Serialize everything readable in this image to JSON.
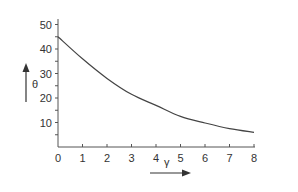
{
  "chart_data": {
    "type": "line",
    "title": "",
    "xlabel": "γ",
    "ylabel": "θ",
    "xlim": [
      0,
      8
    ],
    "ylim": [
      0,
      50
    ],
    "x_ticks": [
      "0",
      "1",
      "2",
      "3",
      "4",
      "5",
      "6",
      "7",
      "8"
    ],
    "y_ticks": [
      "10",
      "20",
      "30",
      "40",
      "50"
    ],
    "y_minor_tick_step": 5,
    "grid": false,
    "legend": null,
    "series": [
      {
        "name": "θ(γ)",
        "x": [
          0,
          1,
          2,
          3,
          4,
          5,
          6,
          7,
          8
        ],
        "values": [
          45,
          36,
          28,
          21.5,
          17,
          12.5,
          9.8,
          7.5,
          6
        ]
      }
    ],
    "annotations": [
      {
        "type": "arrow",
        "direction": "up",
        "label": "θ"
      },
      {
        "type": "arrow",
        "direction": "right",
        "label": "γ"
      }
    ]
  },
  "axes": {
    "x_label": "γ",
    "y_label": "θ",
    "x_tick_labels": [
      "0",
      "1",
      "2",
      "3",
      "4",
      "5",
      "6",
      "7",
      "8"
    ],
    "y_tick_labels": [
      "10",
      "20",
      "30",
      "40",
      "50"
    ]
  },
  "colors": {
    "line": "#444444",
    "axis": "#555555",
    "text": "#333333"
  }
}
